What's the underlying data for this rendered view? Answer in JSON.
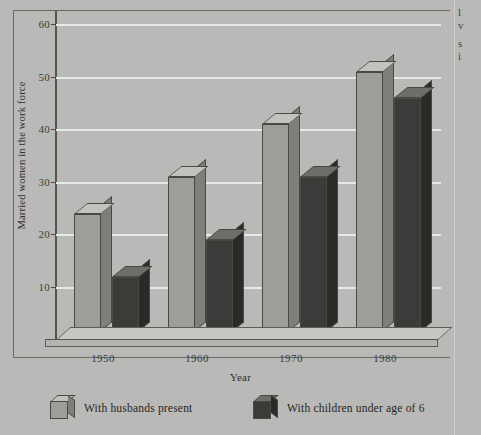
{
  "chart_data": {
    "type": "bar",
    "title": "",
    "xlabel": "Year",
    "ylabel": "Married women in the work force",
    "categories": [
      "1950",
      "1960",
      "1970",
      "1980"
    ],
    "ylim": [
      0,
      63
    ],
    "yticks": [
      10,
      20,
      30,
      40,
      50,
      60
    ],
    "ytick_labels": [
      "10",
      "20",
      "30",
      "40",
      "50",
      "60"
    ],
    "grid": true,
    "legend_position": "bottom",
    "series": [
      {
        "name": "With husbands present",
        "color": "#9d9d9a",
        "values": [
          24,
          31,
          41,
          51
        ]
      },
      {
        "name": "With children under age of 6",
        "color": "#3b3b3a",
        "values": [
          12,
          19,
          31,
          46
        ]
      }
    ]
  },
  "axes": {
    "y_title": "Married women in the work force",
    "x_title": "Year",
    "y_tick_0": "10",
    "y_tick_1": "20",
    "y_tick_2": "30",
    "y_tick_3": "40",
    "y_tick_4": "50",
    "y_tick_5": "60",
    "x_tick_0": "1950",
    "x_tick_1": "1960",
    "x_tick_2": "1970",
    "x_tick_3": "1980"
  },
  "legend": {
    "items": [
      {
        "label": "With husbands present",
        "swatch": "light-cube-icon"
      },
      {
        "label": "With children under age of 6",
        "swatch": "dark-cube-icon"
      }
    ]
  },
  "gutter": {
    "line_1": "l",
    "line_2": "v",
    "line_3": "s",
    "line_4": "i"
  },
  "colors": {
    "figure_background": "#b9b9b7",
    "gridline": "#e8e8e6",
    "axis": "#55544f",
    "series_light": "#9d9d9a",
    "series_dark": "#3b3b3a",
    "text": "#2e2d2a"
  }
}
